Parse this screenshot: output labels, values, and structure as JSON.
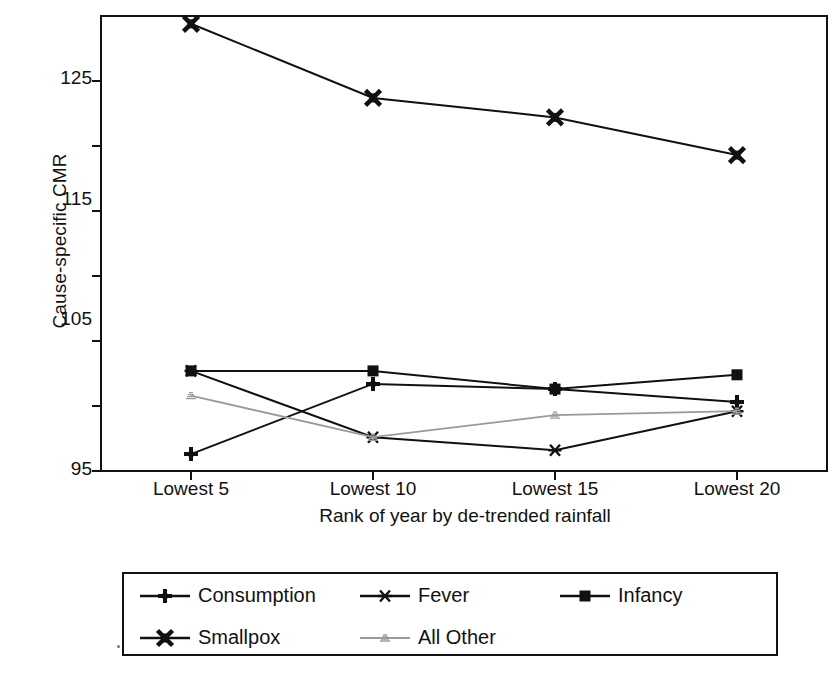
{
  "axes": {
    "ylabel": "Cause-specific CMR",
    "xlabel": "Rank of year by de-trended rainfall",
    "yticks": [
      "125",
      "115",
      "105",
      "95"
    ],
    "xticks": [
      "Lowest 5",
      "Lowest 10",
      "Lowest 15",
      "Lowest 20"
    ]
  },
  "legend": {
    "rows": [
      [
        {
          "label": "Consumption",
          "marker": "plus",
          "color": "#111111"
        },
        {
          "label": "Fever",
          "marker": "asterisk",
          "color": "#111111"
        },
        {
          "label": "Infancy",
          "marker": "square",
          "color": "#111111"
        }
      ],
      [
        {
          "label": "Smallpox",
          "marker": "cross",
          "color": "#111111"
        },
        {
          "label": "All Other",
          "marker": "faint",
          "color": "#9a9a9a"
        }
      ]
    ]
  },
  "chart_data": {
    "type": "line",
    "title": "",
    "xlabel": "Rank of year by de-trended rainfall",
    "ylabel": "Cause-specific CMR",
    "categories": [
      "Lowest 5",
      "Lowest 10",
      "Lowest 15",
      "Lowest 20"
    ],
    "ylim": [
      95,
      130
    ],
    "yticks_major": [
      95,
      105,
      115,
      125
    ],
    "yticks_minor": [
      100,
      110,
      120
    ],
    "grid": false,
    "legend_position": "below-plot",
    "series": [
      {
        "name": "Consumption",
        "marker": "plus",
        "color": "#111111",
        "values": [
          96.3,
          101.7,
          101.3,
          100.3
        ]
      },
      {
        "name": "Fever",
        "marker": "asterisk",
        "color": "#111111",
        "values": [
          102.7,
          97.6,
          96.6,
          99.6
        ]
      },
      {
        "name": "Infancy",
        "marker": "square",
        "color": "#111111",
        "values": [
          102.7,
          102.7,
          101.3,
          102.4
        ]
      },
      {
        "name": "Smallpox",
        "marker": "cross",
        "color": "#111111",
        "values": [
          129.4,
          123.7,
          122.2,
          119.3
        ]
      },
      {
        "name": "All Other",
        "marker": "faint",
        "color": "#9a9a9a",
        "values": [
          100.8,
          97.6,
          99.3,
          99.6
        ]
      }
    ]
  }
}
